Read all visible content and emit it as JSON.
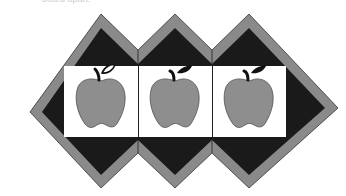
{
  "caption": "board apart.",
  "quilt": {
    "title": "Apple quilt block row",
    "blocks": [
      {
        "label": "apple-1",
        "leaf_style": "outline"
      },
      {
        "label": "apple-2",
        "leaf_style": "filled"
      },
      {
        "label": "apple-3",
        "leaf_style": "filled"
      }
    ],
    "colors": {
      "border": "#8a8a8a",
      "dark": "#1a1a1a",
      "panel": "#ffffff",
      "apple": "#8e8e8e",
      "stem": "#111111"
    }
  }
}
